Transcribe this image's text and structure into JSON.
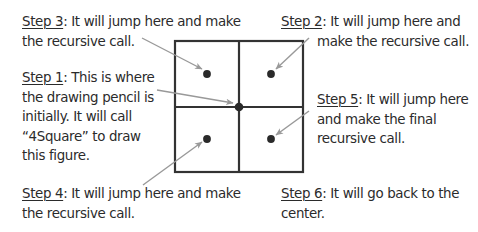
{
  "diagram": {
    "colors": {
      "grid": "#333333",
      "dot": "#2a2a2a",
      "arrow": "#999999",
      "text": "#2b2b2b"
    },
    "square": {
      "x": 175,
      "y": 41,
      "w": 128,
      "h": 131
    },
    "annotations": [
      {
        "id": "step3",
        "step": "Step 3",
        "lines": [
          ": It will jump here and make",
          "the recursive call."
        ]
      },
      {
        "id": "step1",
        "step": "Step 1",
        "lines": [
          ": This is where",
          "the drawing pencil is",
          "initially. It will call",
          "“4Square” to draw",
          "this figure."
        ]
      },
      {
        "id": "step4",
        "step": "Step 4",
        "lines": [
          ": It will jump here and make",
          "the recursive call."
        ]
      },
      {
        "id": "step2",
        "step": "Step 2",
        "lines": [
          ": It will jump here and",
          "make the recursive call."
        ]
      },
      {
        "id": "step5",
        "step": "Step 5",
        "lines": [
          ": It will jump here",
          "and make the final",
          "recursive call."
        ]
      },
      {
        "id": "step6",
        "step": "Step 6",
        "lines": [
          ": It will go back to the",
          "center."
        ]
      }
    ]
  }
}
